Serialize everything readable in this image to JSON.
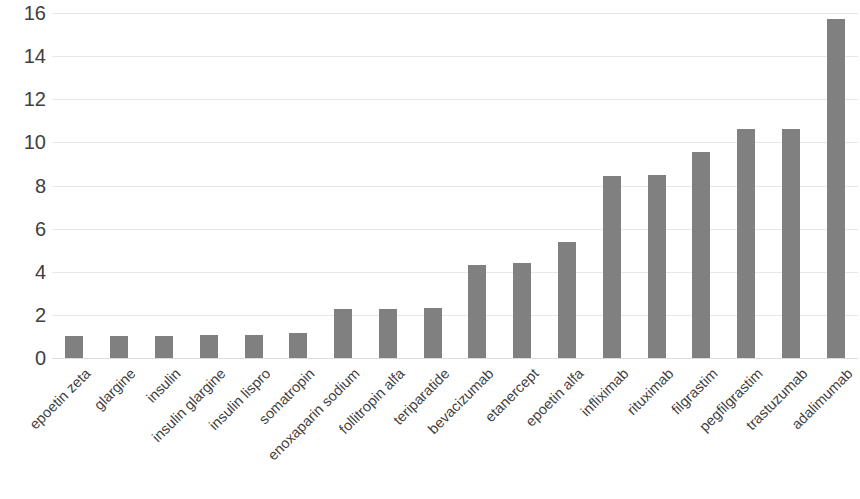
{
  "chart_data": {
    "type": "bar",
    "title": "",
    "subtitle": "",
    "xlabel": "",
    "ylabel": "",
    "ylim": [
      0,
      16
    ],
    "yticks": [
      0,
      2,
      4,
      6,
      8,
      10,
      12,
      14,
      16
    ],
    "grid": true,
    "legend": false,
    "legend_position": "none",
    "bar_color": "#808080",
    "gridline_color": "#e8e8e8",
    "tick_label_color": "#404040",
    "x_tick_rotation": -45,
    "categories": [
      "epoetin zeta",
      "glargine",
      "insulin",
      "insulin glargine",
      "insulin lispro",
      "somatropin",
      "enoxaparin sodium",
      "follitropin alfa",
      "teriparatide",
      "bevacizumab",
      "etanercept",
      "epoetin alfa",
      "infliximab",
      "rituximab",
      "filgrastim",
      "pegfilgrastim",
      "trastuzumab",
      "adalimumab"
    ],
    "values": [
      1.0,
      1.0,
      1.0,
      1.05,
      1.05,
      1.15,
      2.25,
      2.25,
      2.3,
      4.3,
      4.4,
      5.4,
      8.45,
      8.5,
      9.55,
      10.6,
      10.6,
      15.7
    ]
  }
}
